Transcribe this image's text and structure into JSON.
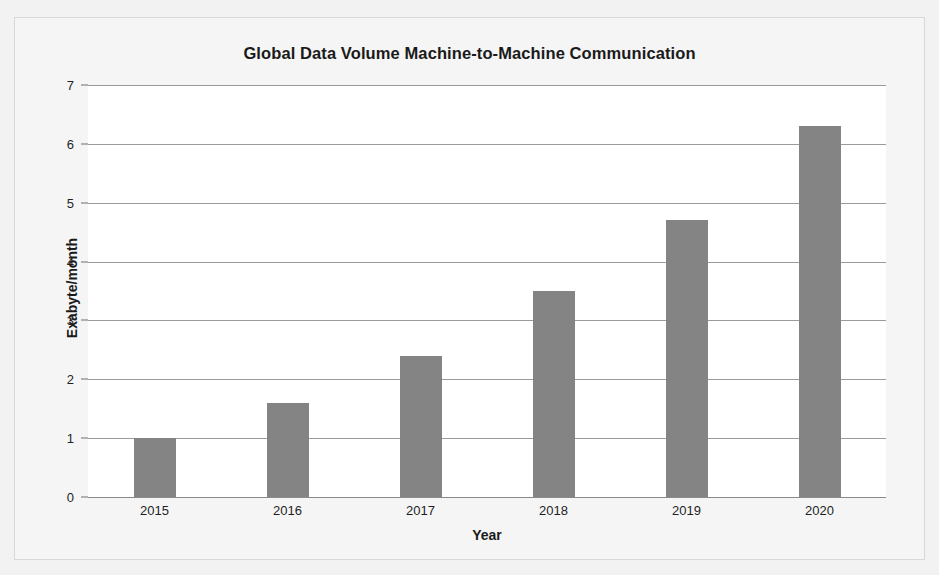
{
  "chart_data": {
    "type": "bar",
    "title": "Global Data Volume Machine-to-Machine Communication",
    "xlabel": "Year",
    "ylabel": "Exabyte/month",
    "categories": [
      "2015",
      "2016",
      "2017",
      "2018",
      "2019",
      "2020"
    ],
    "values": [
      1.0,
      1.6,
      2.4,
      3.5,
      4.7,
      6.3
    ],
    "ylim": [
      0,
      7
    ],
    "ytick_labels": [
      "7",
      "6",
      "5",
      "4",
      "3",
      "2",
      "1",
      "0"
    ],
    "ytick_values": [
      7,
      6,
      5,
      4,
      3,
      2,
      1,
      0
    ],
    "grid": true,
    "legend": "none",
    "bar_color": "#848484",
    "gridline_color": "#9a9a9a",
    "plot_background": "#ffffff",
    "page_background": "#f2f2f2",
    "text_color": "#1a1a1a"
  }
}
